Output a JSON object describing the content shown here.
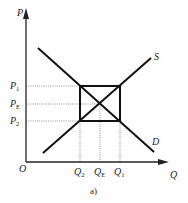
{
  "diagram": {
    "type": "supply-demand",
    "axes": {
      "y_label": "P",
      "x_label": "Q",
      "origin_label": "O"
    },
    "curves": [
      {
        "name": "S",
        "label": "S"
      },
      {
        "name": "D",
        "label": "D"
      }
    ],
    "price_labels": [
      {
        "main": "P",
        "sub": "1"
      },
      {
        "main": "P",
        "sub": "E"
      },
      {
        "main": "P",
        "sub": "2"
      }
    ],
    "quantity_labels": [
      {
        "main": "Q",
        "sub": "2"
      },
      {
        "main": "Q",
        "sub": "E"
      },
      {
        "main": "Q",
        "sub": "1"
      }
    ],
    "caption": "a)"
  }
}
